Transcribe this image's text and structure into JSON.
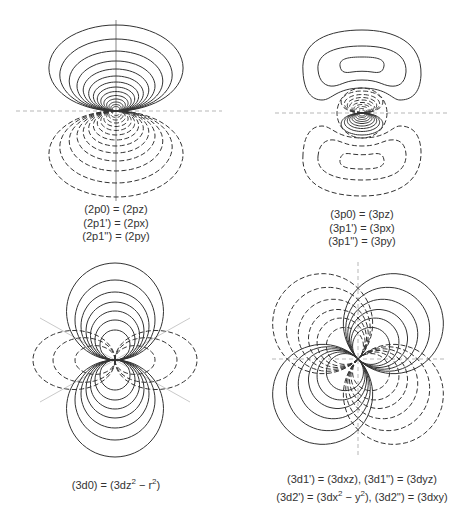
{
  "panels": [
    {
      "id": "2p",
      "labels": [
        "(2p0) = (2pz)",
        "(2p1') = (2px)",
        "(2p1'') = (2py)"
      ],
      "positive_lobe": "top",
      "negative_lobe": "bottom"
    },
    {
      "id": "3p",
      "labels": [
        "(3p0) = (3pz)",
        "(3p1') = (3px)",
        "(3p1'') = (3py)"
      ],
      "outer_positive_lobe": "top",
      "inner_positive_lobe": "bottom"
    },
    {
      "id": "3d0",
      "label_parts": [
        "(3d0) = (3dz",
        "2",
        " − r",
        "2",
        ")"
      ]
    },
    {
      "id": "3d-clover",
      "line1": "(3d1') = (3dxz), (3d1'') = (3dyz)",
      "line2_parts": [
        "(3d2') = (3dx",
        "2",
        " − y",
        "2",
        "), (3d2'') = (3dxy)"
      ]
    }
  ],
  "legend": {
    "solid": "positive phase",
    "dashed": "negative phase"
  }
}
